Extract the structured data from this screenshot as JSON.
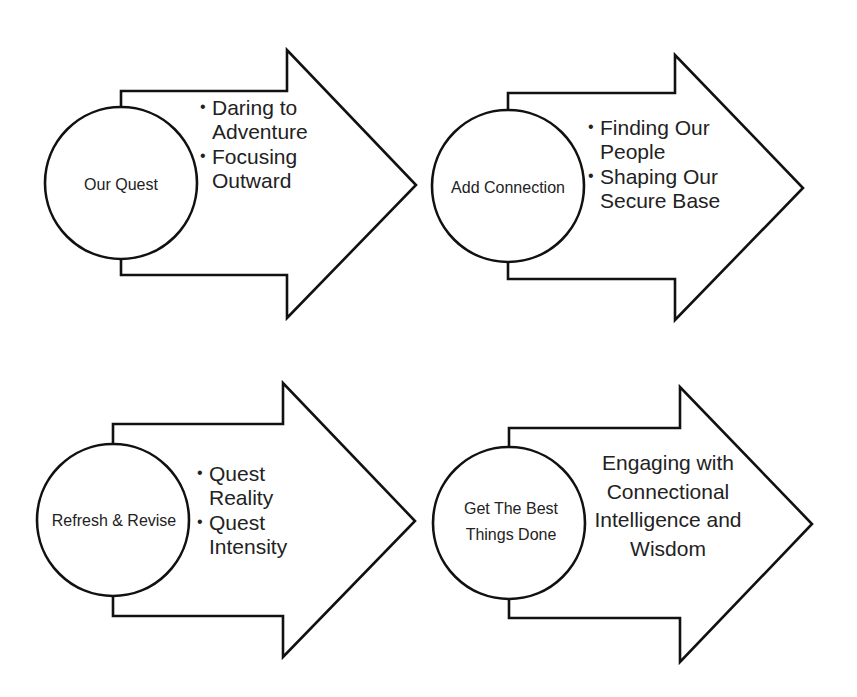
{
  "diagram": {
    "type": "four-step arrow process",
    "steps": [
      {
        "circle_label": "Our Quest",
        "bullets": [
          "Daring to Adventure",
          "Focusing Outward"
        ]
      },
      {
        "circle_label": "Add Connection",
        "bullets": [
          "Finding Our People",
          "Shaping Our Secure Base"
        ]
      },
      {
        "circle_label": "Refresh & Revise",
        "bullets": [
          "Quest Reality",
          "Quest Intensity"
        ]
      },
      {
        "circle_label": "Get The Best Things Done",
        "text": "Engaging with Connectional Intelligence and Wisdom"
      }
    ],
    "colors": {
      "stroke": "#111111",
      "fill": "#ffffff",
      "text": "#222222"
    }
  }
}
